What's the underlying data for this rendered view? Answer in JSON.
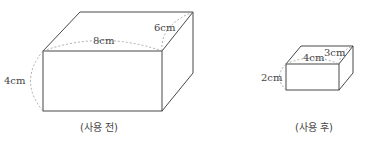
{
  "before": {
    "caption": "(사용 전)",
    "length": "8cm",
    "depth": "6cm",
    "height": "4cm"
  },
  "after": {
    "caption": "(사용 후)",
    "length": "4cm",
    "depth": "3cm",
    "height": "2cm"
  },
  "colors": {
    "line": "#333333",
    "dashed": "#999999",
    "text": "#444444"
  }
}
